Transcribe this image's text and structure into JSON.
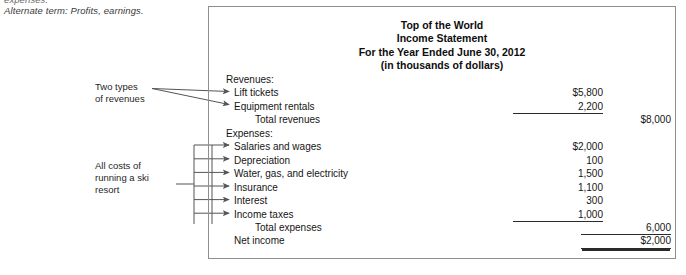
{
  "margin_notes": {
    "cutoff_text": "expenses.",
    "alternate_term": "Alternate term: Profits, earnings."
  },
  "callouts": {
    "revenues": "Two types\nof revenues",
    "expenses": "All costs of\nrunning a ski\nresort"
  },
  "statement": {
    "title_lines": [
      "Top of the World",
      "Income Statement",
      "For the Year Ended June 30, 2012",
      "(in thousands of dollars)"
    ],
    "rows": [
      {
        "label": "Revenues:",
        "level": "head",
        "col1": "",
        "col2": "",
        "rule": "none"
      },
      {
        "label": "Lift tickets",
        "level": "item",
        "col1": "$5,800",
        "col2": "",
        "rule": "none"
      },
      {
        "label": "Equipment rentals",
        "level": "item",
        "col1": "2,200",
        "col2": "",
        "rule": "single"
      },
      {
        "label": "Total revenues",
        "level": "total",
        "col1": "",
        "col2": "$8,000",
        "rule": "none"
      },
      {
        "label": "Expenses:",
        "level": "head",
        "col1": "",
        "col2": "",
        "rule": "none"
      },
      {
        "label": "Salaries and wages",
        "level": "item",
        "col1": "$2,000",
        "col2": "",
        "rule": "none"
      },
      {
        "label": "Depreciation",
        "level": "item",
        "col1": "100",
        "col2": "",
        "rule": "none"
      },
      {
        "label": "Water, gas, and electricity",
        "level": "item",
        "col1": "1,500",
        "col2": "",
        "rule": "none"
      },
      {
        "label": "Insurance",
        "level": "item",
        "col1": "1,100",
        "col2": "",
        "rule": "none"
      },
      {
        "label": "Interest",
        "level": "item",
        "col1": "300",
        "col2": "",
        "rule": "none"
      },
      {
        "label": "Income taxes",
        "level": "item",
        "col1": "1,000",
        "col2": "",
        "rule": "single"
      },
      {
        "label": "Total expenses",
        "level": "total",
        "col1": "",
        "col2": "6,000",
        "rule": "single"
      },
      {
        "label": "Net income",
        "level": "net",
        "col1": "",
        "col2": "$2,000",
        "rule": "double"
      }
    ]
  },
  "chart_data": {
    "type": "table",
    "title": "Top of the World Income Statement",
    "subtitle": "For the Year Ended June 30, 2012 (in thousands of dollars)",
    "categories": [
      "Lift tickets",
      "Equipment rentals",
      "Total revenues",
      "Salaries and wages",
      "Depreciation",
      "Water, gas, and electricity",
      "Insurance",
      "Interest",
      "Income taxes",
      "Total expenses",
      "Net income"
    ],
    "values": [
      5800,
      2200,
      8000,
      2000,
      100,
      1500,
      1100,
      300,
      1000,
      6000,
      2000
    ],
    "ylabel": "Thousands of dollars"
  },
  "colors": {
    "frame": "#8e8e8e",
    "rule": "#2a2a2a",
    "connector": "#555555",
    "text": "#151515"
  }
}
